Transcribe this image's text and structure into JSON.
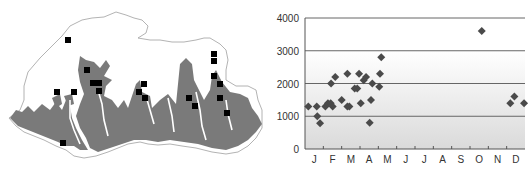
{
  "map": {
    "description": "Outline map with shaded elevation zone and black square sample locations",
    "colors": {
      "outline": "#9a9a9a",
      "zone_fill": "#7a7a7a",
      "marker": "#000000",
      "background": "#ffffff"
    },
    "markers": [
      [
        68,
        40
      ],
      [
        87,
        70
      ],
      [
        93,
        83
      ],
      [
        99,
        83
      ],
      [
        99,
        91
      ],
      [
        57,
        92
      ],
      [
        74,
        92
      ],
      [
        144,
        84
      ],
      [
        139,
        92
      ],
      [
        145,
        98
      ],
      [
        63,
        143
      ],
      [
        189,
        98
      ],
      [
        195,
        106
      ],
      [
        214,
        54
      ],
      [
        214,
        61
      ],
      [
        214,
        76
      ],
      [
        220,
        84
      ],
      [
        220,
        98
      ],
      [
        227,
        113
      ]
    ]
  },
  "chart_data": {
    "type": "scatter",
    "title": "",
    "xlabel": "",
    "ylabel": "",
    "categories": [
      "J",
      "F",
      "M",
      "A",
      "M",
      "J",
      "J",
      "A",
      "S",
      "O",
      "N",
      "D"
    ],
    "ylim": [
      0,
      4000
    ],
    "yticks": [
      0,
      1000,
      2000,
      3000,
      4000
    ],
    "grid": true,
    "legend": null,
    "series": [
      {
        "name": "observations",
        "marker": "diamond",
        "color": "#4a4a4a",
        "points": [
          {
            "month_pos": 0.18,
            "value": 1300
          },
          {
            "month_pos": 0.64,
            "value": 1300
          },
          {
            "month_pos": 0.67,
            "value": 1000
          },
          {
            "month_pos": 0.82,
            "value": 790
          },
          {
            "month_pos": 1.11,
            "value": 1300
          },
          {
            "month_pos": 1.25,
            "value": 1400
          },
          {
            "month_pos": 1.4,
            "value": 1400
          },
          {
            "month_pos": 1.51,
            "value": 1300
          },
          {
            "month_pos": 1.42,
            "value": 2000
          },
          {
            "month_pos": 1.65,
            "value": 2200
          },
          {
            "month_pos": 2.0,
            "value": 1500
          },
          {
            "month_pos": 2.31,
            "value": 2300
          },
          {
            "month_pos": 2.31,
            "value": 1300
          },
          {
            "month_pos": 2.42,
            "value": 1300
          },
          {
            "month_pos": 2.71,
            "value": 1850
          },
          {
            "month_pos": 2.85,
            "value": 1850
          },
          {
            "month_pos": 2.95,
            "value": 2300
          },
          {
            "month_pos": 3.04,
            "value": 1400
          },
          {
            "month_pos": 3.2,
            "value": 2100
          },
          {
            "month_pos": 3.33,
            "value": 2200
          },
          {
            "month_pos": 3.53,
            "value": 800
          },
          {
            "month_pos": 3.6,
            "value": 1500
          },
          {
            "month_pos": 3.67,
            "value": 2000
          },
          {
            "month_pos": 4.05,
            "value": 1900
          },
          {
            "month_pos": 4.09,
            "value": 2300
          },
          {
            "month_pos": 4.16,
            "value": 2800
          },
          {
            "month_pos": 9.64,
            "value": 3600
          },
          {
            "month_pos": 11.2,
            "value": 1400
          },
          {
            "month_pos": 11.42,
            "value": 1600
          },
          {
            "month_pos": 11.95,
            "value": 1400
          }
        ]
      }
    ],
    "colors": {
      "axis": "#555555",
      "gridline": "#666666",
      "band_top": "#ffffff",
      "band_bottom": "#dcdcdc",
      "marker": "#4a4a4a"
    }
  }
}
